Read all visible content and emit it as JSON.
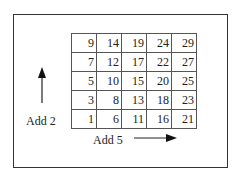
{
  "grid": {
    "rows": [
      [
        9,
        14,
        19,
        24,
        29
      ],
      [
        7,
        12,
        17,
        22,
        27
      ],
      [
        5,
        10,
        15,
        20,
        25
      ],
      [
        3,
        8,
        13,
        18,
        23
      ],
      [
        1,
        6,
        11,
        16,
        21
      ]
    ]
  },
  "labels": {
    "vertical": "Add 2",
    "horizontal": "Add 5"
  }
}
